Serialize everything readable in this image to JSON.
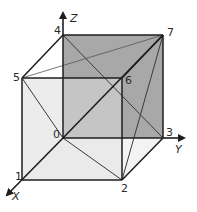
{
  "diagram": {
    "type": "cube-vertex-diagram",
    "axes": {
      "x_label": "X",
      "y_label": "Y",
      "z_label": "Z"
    },
    "vertices": [
      {
        "id": "0",
        "label": "0"
      },
      {
        "id": "1",
        "label": "1"
      },
      {
        "id": "2",
        "label": "2"
      },
      {
        "id": "3",
        "label": "3"
      },
      {
        "id": "4",
        "label": "4"
      },
      {
        "id": "5",
        "label": "5"
      },
      {
        "id": "6",
        "label": "6"
      },
      {
        "id": "7",
        "label": "7"
      }
    ],
    "colors": {
      "back_face": "#a8a8a8",
      "front_face": "#dcdcdc",
      "edge": "#1e1e1e",
      "diagonal": "#3a3a3a"
    },
    "edges": [
      [
        "0",
        "1"
      ],
      [
        "0",
        "3"
      ],
      [
        "0",
        "4"
      ],
      [
        "1",
        "2"
      ],
      [
        "2",
        "3"
      ],
      [
        "1",
        "5"
      ],
      [
        "2",
        "6"
      ],
      [
        "3",
        "7"
      ],
      [
        "4",
        "5"
      ],
      [
        "4",
        "7"
      ],
      [
        "5",
        "6"
      ],
      [
        "6",
        "7"
      ]
    ],
    "diagonals": [
      [
        "0",
        "7"
      ],
      [
        "4",
        "3"
      ],
      [
        "5",
        "7"
      ],
      [
        "5",
        "0"
      ],
      [
        "0",
        "2"
      ],
      [
        "2",
        "7"
      ]
    ]
  }
}
